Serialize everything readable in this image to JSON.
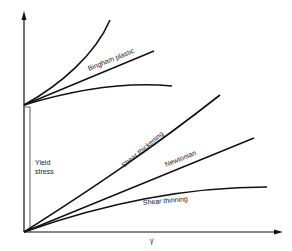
{
  "diagram": {
    "x_axis_label": "γ̇",
    "y_axis_label": "",
    "yield_label_line1": "Yield",
    "yield_label_line2": "stress",
    "curves": [
      {
        "name": "Bingham plastic",
        "group": "upper"
      },
      {
        "name": "Shear thickening",
        "group": "lower"
      },
      {
        "name": "Newtonian",
        "group": "lower"
      },
      {
        "name": "Shear thinning",
        "group": "lower"
      }
    ],
    "colors": {
      "line": "#111111",
      "text": "#222222",
      "background": "#ffffff"
    }
  }
}
